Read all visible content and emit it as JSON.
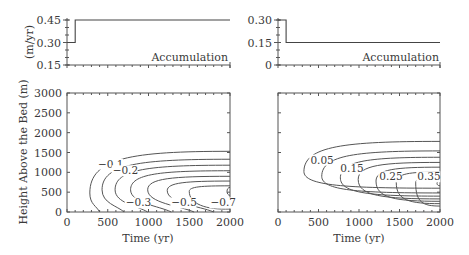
{
  "chart_data": [
    {
      "id": "accum-left",
      "type": "line",
      "panel_label": "Accumulation",
      "ylabel": "(m/yr)",
      "xlim": [
        0,
        2000
      ],
      "ylim": [
        0.15,
        0.45
      ],
      "yticks": [
        0.15,
        0.3,
        0.45
      ],
      "ytick_labels": [
        "0.15",
        "0.30",
        "0.45"
      ],
      "series": [
        {
          "name": "Accumulation",
          "x": [
            0,
            100,
            100,
            2000
          ],
          "y": [
            0.3,
            0.3,
            0.45,
            0.45
          ]
        }
      ]
    },
    {
      "id": "accum-right",
      "type": "line",
      "panel_label": "Accumulation",
      "ylabel": "",
      "xlim": [
        0,
        2000
      ],
      "ylim": [
        0,
        0.3
      ],
      "yticks": [
        0,
        0.15,
        0.3
      ],
      "ytick_labels": [
        "0",
        "0.15",
        "0.30"
      ],
      "series": [
        {
          "name": "Accumulation",
          "x": [
            0,
            100,
            100,
            2000
          ],
          "y": [
            0.3,
            0.3,
            0.15,
            0.15
          ]
        }
      ]
    },
    {
      "id": "contour-left",
      "type": "contour",
      "xlabel": "Time (yr)",
      "ylabel": "Height Above the Bed (m)",
      "xlim": [
        0,
        2000
      ],
      "ylim": [
        0,
        3000
      ],
      "xticks": [
        0,
        500,
        1000,
        1500,
        2000
      ],
      "xtick_labels": [
        "0",
        "500",
        "1000",
        "1500",
        "2000"
      ],
      "yticks": [
        0,
        500,
        1000,
        1500,
        2000,
        2500,
        3000
      ],
      "ytick_labels": [
        "0",
        "500",
        "1000",
        "1500",
        "2000",
        "2500",
        "3000"
      ],
      "levels": [
        -0.1,
        -0.2,
        -0.3,
        -0.4,
        -0.5,
        -0.6,
        -0.7,
        -0.8
      ],
      "level_labels": [
        "−0.1",
        "−0.2",
        "−0.3",
        "−0.5",
        "−0.7"
      ],
      "contours": [
        {
          "level": -0.1,
          "start_time": 280,
          "top": 1530,
          "bottom_time": 400,
          "center": 480
        },
        {
          "level": -0.2,
          "start_time": 430,
          "top": 1330,
          "bottom_time": 700,
          "center": 560
        },
        {
          "level": -0.3,
          "start_time": 590,
          "top": 1180,
          "bottom_time": 990,
          "center": 560
        },
        {
          "level": -0.4,
          "start_time": 780,
          "top": 1040,
          "bottom_time": 1280,
          "center": 560
        },
        {
          "level": -0.5,
          "start_time": 990,
          "top": 900,
          "bottom_time": 1560,
          "center": 560
        },
        {
          "level": -0.6,
          "start_time": 1230,
          "top": 780,
          "bottom_time": 1800,
          "center": 540
        },
        {
          "level": -0.7,
          "start_time": 1500,
          "top": 660,
          "bottom_time": 2000,
          "center": 520
        },
        {
          "level": -0.8,
          "start_time": 1960,
          "top": 580,
          "bottom_time": 2000,
          "center": 480
        }
      ]
    },
    {
      "id": "contour-right",
      "type": "contour",
      "xlabel": "Time (yr)",
      "ylabel": "",
      "xlim": [
        0,
        2000
      ],
      "ylim": [
        0,
        3000
      ],
      "xticks": [
        0,
        500,
        1000,
        1500,
        2000
      ],
      "xtick_labels": [
        "0",
        "500",
        "1000",
        "1500",
        "2000"
      ],
      "levels": [
        0.05,
        0.1,
        0.15,
        0.2,
        0.25,
        0.3,
        0.35,
        0.4
      ],
      "level_labels": [
        "0.05",
        "0.15",
        "0.25",
        "0.35"
      ],
      "contours": [
        {
          "level": 0.05,
          "start_time": 320,
          "top": 1780,
          "bottom": 600,
          "center": 1020
        },
        {
          "level": 0.1,
          "start_time": 540,
          "top": 1540,
          "bottom": 480,
          "center": 900
        },
        {
          "level": 0.15,
          "start_time": 770,
          "top": 1380,
          "bottom": 400,
          "center": 860
        },
        {
          "level": 0.2,
          "start_time": 990,
          "top": 1250,
          "bottom": 330,
          "center": 820
        },
        {
          "level": 0.25,
          "start_time": 1210,
          "top": 1130,
          "bottom": 270,
          "center": 780
        },
        {
          "level": 0.3,
          "start_time": 1460,
          "top": 1010,
          "bottom": 210,
          "center": 740
        },
        {
          "level": 0.35,
          "start_time": 1700,
          "top": 890,
          "bottom": 150,
          "center": 730
        },
        {
          "level": 0.4,
          "start_time": 1990,
          "top": 780,
          "bottom": 660,
          "center": 720
        }
      ]
    }
  ]
}
